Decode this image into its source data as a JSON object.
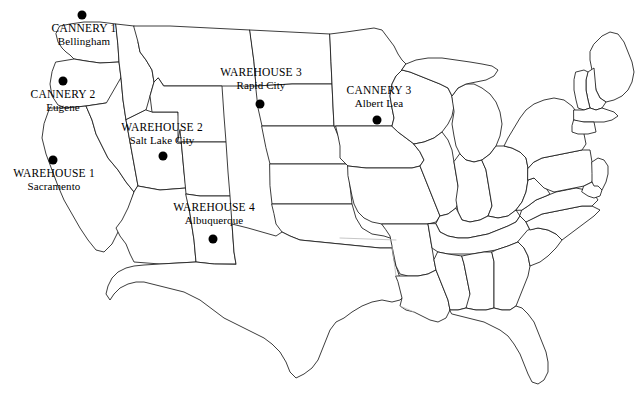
{
  "map": {
    "title": "United States Facility Location Map",
    "background_color": "#ffffff",
    "outline_color": "#1a1a1a",
    "marker_color": "#000000",
    "width": 639,
    "height": 395
  },
  "sites": [
    {
      "id": "cannery-1",
      "name": "CANNERY 1",
      "city": "Bellingham",
      "dot_x": 82,
      "dot_y": 15,
      "label_x": 84,
      "label_y": 22
    },
    {
      "id": "cannery-2",
      "name": "CANNERY 2",
      "city": "Eugene",
      "dot_x": 63,
      "dot_y": 81,
      "label_x": 63,
      "label_y": 88
    },
    {
      "id": "warehouse-1",
      "name": "WAREHOUSE 1",
      "city": "Sacramento",
      "dot_x": 53,
      "dot_y": 160,
      "label_x": 54,
      "label_y": 167
    },
    {
      "id": "warehouse-2",
      "name": "WAREHOUSE 2",
      "city": "Salt Lake City",
      "dot_x": 163,
      "dot_y": 156,
      "label_x": 162,
      "label_y": 121
    },
    {
      "id": "warehouse-3",
      "name": "WAREHOUSE 3",
      "city": "Rapid City",
      "dot_x": 260,
      "dot_y": 104,
      "label_x": 261,
      "label_y": 66
    },
    {
      "id": "warehouse-4",
      "name": "WAREHOUSE 4",
      "city": "Albuquerque",
      "dot_x": 213,
      "dot_y": 239,
      "label_x": 214,
      "label_y": 201
    },
    {
      "id": "cannery-3",
      "name": "CANNERY 3",
      "city": "Albert Lea",
      "dot_x": 377,
      "dot_y": 120,
      "label_x": 379,
      "label_y": 84
    }
  ]
}
